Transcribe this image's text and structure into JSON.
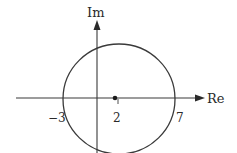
{
  "diagram": {
    "type": "complex-plane-circle",
    "axes": {
      "imaginary_label": "Im",
      "real_label": "Re"
    },
    "circle": {
      "center_label": "2",
      "left_intercept_label": "−3",
      "right_intercept_label": "7",
      "center_value": 2,
      "left_intercept": -3,
      "right_intercept": 7
    },
    "colors": {
      "stroke": "#333333",
      "background": "#ffffff"
    }
  }
}
